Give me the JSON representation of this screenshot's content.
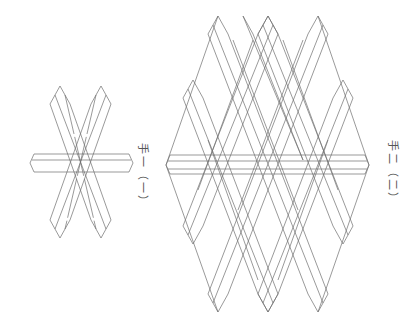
{
  "figures": [
    {
      "id": "fig-1",
      "label": "手一（一）",
      "label_x": 152,
      "label_y": 143
    },
    {
      "id": "fig-2",
      "label": "手二（二）",
      "label_x": 402,
      "label_y": 140
    }
  ],
  "colors": {
    "line": "#6e6e6e",
    "background": "#ffffff"
  }
}
